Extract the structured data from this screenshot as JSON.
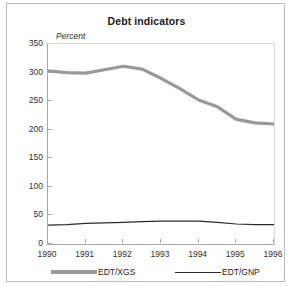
{
  "figure": {
    "title": "Debt indicators",
    "y_axis_label": "Percent"
  },
  "legend": {
    "entries": [
      {
        "label": "EDT/XGS",
        "style": "thick-gray",
        "color": "#989898"
      },
      {
        "label": "EDT/GNP",
        "style": "thin-black",
        "color": "#2a2a2a"
      }
    ]
  },
  "chart_data": {
    "type": "line",
    "title": "Debt indicators",
    "xlabel": "",
    "ylabel": "Percent",
    "ylim": [
      0,
      350
    ],
    "ytick_labels": [
      "0",
      "50",
      "100",
      "150",
      "200",
      "250",
      "300",
      "350"
    ],
    "yticks": [
      0,
      50,
      100,
      150,
      200,
      250,
      300,
      350
    ],
    "xlim": [
      1990,
      1996
    ],
    "xtick_labels": [
      "1990",
      "1991",
      "1992",
      "1993",
      "1994",
      "1995",
      "1996"
    ],
    "xticks": [
      1990,
      1991,
      1992,
      1993,
      1994,
      1995,
      1996
    ],
    "grid": false,
    "legend_position": "below",
    "x": [
      1990,
      1990.5,
      1991,
      1991.5,
      1992,
      1992.5,
      1993,
      1993.5,
      1994,
      1994.5,
      1995,
      1995.5,
      1996
    ],
    "series": [
      {
        "name": "EDT/XGS",
        "color": "#989898",
        "linewidth": 3.2,
        "values": [
          303,
          300,
          299,
          305,
          311,
          306,
          290,
          272,
          252,
          240,
          218,
          212,
          210
        ]
      },
      {
        "name": "EDT/GNP",
        "color": "#2a2a2a",
        "linewidth": 1.2,
        "values": [
          33,
          34,
          36,
          37,
          38,
          39,
          40,
          40,
          40,
          38,
          35,
          34,
          34
        ]
      }
    ]
  }
}
